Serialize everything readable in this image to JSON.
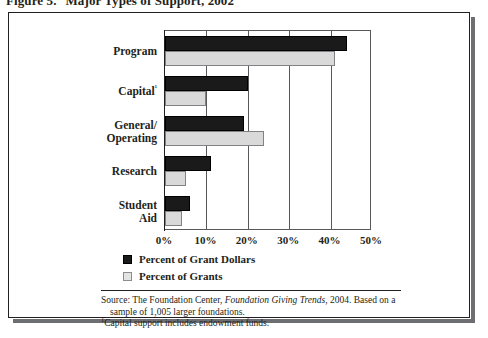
{
  "figure": {
    "number_label": "Figure 5.",
    "title": "Major Types of Support, 2002"
  },
  "legend": {
    "items": [
      {
        "label": "Percent of Grant Dollars",
        "color": "#1a1a1a"
      },
      {
        "label": "Percent of Grants",
        "color": "#e3e3e3"
      }
    ]
  },
  "source": {
    "line1_prefix": "Source: The Foundation Center, ",
    "line1_italic": "Foundation Giving Trends",
    "line1_suffix": ", 2004. Based on a",
    "line2": "sample of 1,005 larger foundations.",
    "footnote_marker": "1",
    "footnote_text": "Capital support includes endowment funds."
  },
  "chart_data": {
    "type": "bar",
    "orientation": "horizontal",
    "title": "Major Types of Support, 2002",
    "xlabel": "",
    "ylabel": "",
    "xlim": [
      0,
      50
    ],
    "xtick_labels": [
      "0%",
      "10%",
      "20%",
      "30%",
      "40%",
      "50%"
    ],
    "xtick_values": [
      0,
      10,
      20,
      30,
      40,
      50
    ],
    "grid": true,
    "legend_position": "below-left",
    "categories": [
      "Program",
      "Capital¹",
      "General/\nOperating",
      "Research",
      "Student\nAid"
    ],
    "series": [
      {
        "name": "Percent of Grant Dollars",
        "color": "#1a1a1a",
        "values": [
          44,
          20,
          19,
          11,
          6
        ]
      },
      {
        "name": "Percent of Grants",
        "color": "#e3e3e3",
        "values": [
          41,
          10,
          24,
          5,
          4
        ]
      }
    ]
  }
}
